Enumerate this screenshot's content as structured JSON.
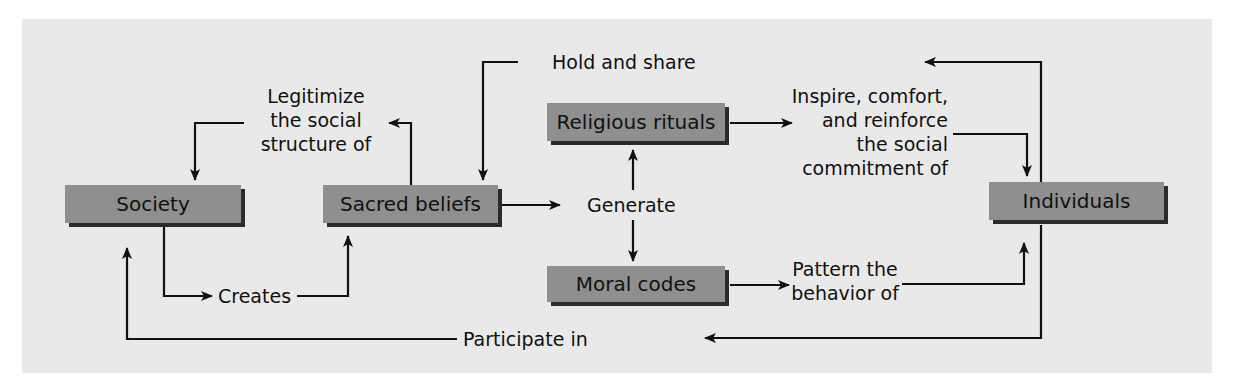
{
  "diagram": {
    "nodes": {
      "society": "Society",
      "sacred_beliefs": "Sacred beliefs",
      "religious_rituals": "Religious rituals",
      "moral_codes": "Moral codes",
      "individuals": "Individuals"
    },
    "edges": {
      "legitimize": [
        "Legitimize",
        "the social",
        "structure of"
      ],
      "hold_and_share": "Hold and share",
      "inspire": [
        "Inspire, comfort,",
        "and reinforce",
        "the social",
        "commitment of"
      ],
      "generate": "Generate",
      "creates": "Creates",
      "pattern": [
        "Pattern the",
        "behavior of"
      ],
      "participate_in": "Participate in"
    }
  },
  "colors": {
    "panel": "#e9e9e9",
    "box": "#8f8f8f",
    "box_shadow": "#2b2b2b",
    "line": "#111111"
  }
}
